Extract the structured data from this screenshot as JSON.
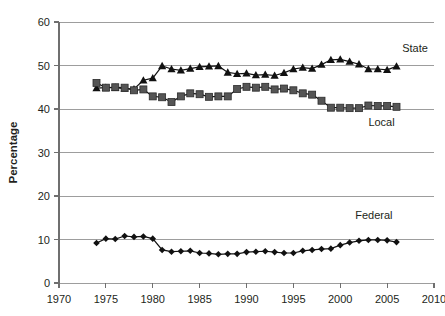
{
  "chart_data": {
    "type": "line",
    "title": "",
    "subtitle": "",
    "xlabel": "",
    "ylabel": "Percentage",
    "xlim": [
      1970,
      2010
    ],
    "ylim": [
      0,
      60
    ],
    "xticks": [
      1970,
      1975,
      1980,
      1985,
      1990,
      1995,
      2000,
      2005,
      2010
    ],
    "yticks": [
      0,
      10,
      20,
      30,
      40,
      50,
      60
    ],
    "grid": "horizontal",
    "legend_position": "inline-annotations",
    "x": [
      1974,
      1975,
      1976,
      1977,
      1978,
      1979,
      1980,
      1981,
      1982,
      1983,
      1984,
      1985,
      1986,
      1987,
      1988,
      1989,
      1990,
      1991,
      1992,
      1993,
      1994,
      1995,
      1996,
      1997,
      1998,
      1999,
      2000,
      2001,
      2002,
      2003,
      2004,
      2005,
      2006
    ],
    "series": [
      {
        "name": "State",
        "marker": "triangle",
        "color": "#111111",
        "values": [
          44.8,
          44.9,
          44.9,
          44.7,
          44.6,
          46.6,
          47.1,
          49.9,
          49.2,
          48.9,
          49.3,
          49.7,
          49.8,
          49.9,
          48.4,
          48.1,
          48.2,
          47.8,
          47.9,
          47.7,
          48.3,
          49.2,
          49.5,
          49.3,
          50.2,
          51.3,
          51.4,
          50.9,
          50.3,
          49.2,
          49.2,
          49.0,
          49.8
        ]
      },
      {
        "name": "Local",
        "marker": "square",
        "color": "#555555",
        "values": [
          46.0,
          44.9,
          45.0,
          44.9,
          44.3,
          44.5,
          42.9,
          42.7,
          41.6,
          42.9,
          43.6,
          43.4,
          42.8,
          42.9,
          42.9,
          44.6,
          45.1,
          44.9,
          45.1,
          44.5,
          44.7,
          44.3,
          43.6,
          43.3,
          41.9,
          40.3,
          40.3,
          40.2,
          40.2,
          40.8,
          40.7,
          40.7,
          40.5
        ]
      },
      {
        "name": "Federal",
        "marker": "diamond",
        "color": "#111111",
        "values": [
          9.2,
          10.2,
          10.1,
          10.8,
          10.6,
          10.7,
          10.2,
          7.6,
          7.2,
          7.3,
          7.4,
          6.9,
          6.8,
          6.6,
          6.7,
          6.7,
          7.1,
          7.2,
          7.3,
          7.1,
          6.9,
          6.9,
          7.4,
          7.6,
          7.8,
          7.9,
          8.7,
          9.3,
          9.7,
          9.9,
          9.9,
          9.8,
          9.4
        ]
      }
    ],
    "annotations": [
      {
        "text": "State",
        "x": 2006.6,
        "y": 53.0
      },
      {
        "text": "Local",
        "x": 2003.0,
        "y": 36.0
      },
      {
        "text": "Federal",
        "x": 2001.6,
        "y": 14.8
      }
    ]
  }
}
